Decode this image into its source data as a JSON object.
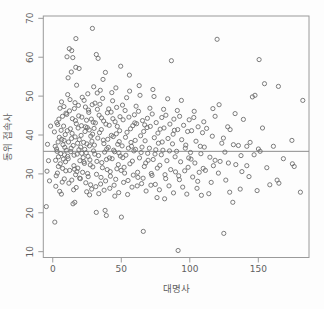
{
  "chart_data": {
    "type": "scatter",
    "title": "",
    "xlabel": "대명사",
    "ylabel": "동위 접속사",
    "x_ticks": [
      0,
      50,
      100,
      150
    ],
    "y_ticks": [
      10,
      20,
      30,
      40,
      50,
      60,
      70
    ],
    "xlim": [
      -6.9,
      187
    ],
    "ylim": [
      8.5,
      70.6
    ],
    "grid": false,
    "legend": "none",
    "marker": "open-circle",
    "hline_y": 35.8,
    "colors": {
      "background": "#fdfdfd",
      "box": "#9a9a9a",
      "points": "#6e6e6e",
      "hline": "#8c8c8c",
      "text": "#5f5f5f"
    },
    "points": [
      [
        -4.7,
        21.6
      ],
      [
        -3.1,
        33.4
      ],
      [
        -2.4,
        28.2
      ],
      [
        -3.8,
        37.6
      ],
      [
        -1.6,
        42.3
      ],
      [
        -4.2,
        30.7
      ],
      [
        1.5,
        17.6
      ],
      [
        2.1,
        33.5
      ],
      [
        2.8,
        36.4
      ],
      [
        3.4,
        30.2
      ],
      [
        1.2,
        40.8
      ],
      [
        4.5,
        44.1
      ],
      [
        5.1,
        25.5
      ],
      [
        6.3,
        24.8
      ],
      [
        5.8,
        35.2
      ],
      [
        6.6,
        38.9
      ],
      [
        7.2,
        31.4
      ],
      [
        7.9,
        42.3
      ],
      [
        8.4,
        28.7
      ],
      [
        8.8,
        36.8
      ],
      [
        9.3,
        33.1
      ],
      [
        9.7,
        45.6
      ],
      [
        3.9,
        38.2
      ],
      [
        4.2,
        34.4
      ],
      [
        2.5,
        29.5
      ],
      [
        6.1,
        41.2
      ],
      [
        7.5,
        37.5
      ],
      [
        8.1,
        47.3
      ],
      [
        9.1,
        40.1
      ],
      [
        5.5,
        32.6
      ],
      [
        3.1,
        35.8
      ],
      [
        6.9,
        27.9
      ],
      [
        9.5,
        30.8
      ],
      [
        4.8,
        39.4
      ],
      [
        2.9,
        43.2
      ],
      [
        8.6,
        34.9
      ],
      [
        1.8,
        37.1
      ],
      [
        7.1,
        44.8
      ],
      [
        5.3,
        46.9
      ],
      [
        9.9,
        36.1
      ],
      [
        4.1,
        31.9
      ],
      [
        6.4,
        48.5
      ],
      [
        3.6,
        42.7
      ],
      [
        8.3,
        38.6
      ],
      [
        2.2,
        26.8
      ],
      [
        7.7,
        33.8
      ],
      [
        10.4,
        60.1
      ],
      [
        12.1,
        62.2
      ],
      [
        13.8,
        61.7
      ],
      [
        14.6,
        59.9
      ],
      [
        16.9,
        64.8
      ],
      [
        13.5,
        56.2
      ],
      [
        16.8,
        57.4
      ],
      [
        19.2,
        57.1
      ],
      [
        11.2,
        54.7
      ],
      [
        17.4,
        52.8
      ],
      [
        14.8,
        22.3
      ],
      [
        16.1,
        22.7
      ],
      [
        10.8,
        34.5
      ],
      [
        11.5,
        38.2
      ],
      [
        12.4,
        30.9
      ],
      [
        12.9,
        41.6
      ],
      [
        13.2,
        35.7
      ],
      [
        13.9,
        28.4
      ],
      [
        14.3,
        44.2
      ],
      [
        14.9,
        37.3
      ],
      [
        15.4,
        32.1
      ],
      [
        15.8,
        46.8
      ],
      [
        16.3,
        39.5
      ],
      [
        16.7,
        29.8
      ],
      [
        17.2,
        42.9
      ],
      [
        17.8,
        35.1
      ],
      [
        18.3,
        31.5
      ],
      [
        18.7,
        47.6
      ],
      [
        19.4,
        38.8
      ],
      [
        19.8,
        33.4
      ],
      [
        10.2,
        45.3
      ],
      [
        11.8,
        27.6
      ],
      [
        12.6,
        49.1
      ],
      [
        13.4,
        36.6
      ],
      [
        14.1,
        40.4
      ],
      [
        15.2,
        25.9
      ],
      [
        16.5,
        43.7
      ],
      [
        17.6,
        30.6
      ],
      [
        18.1,
        37.9
      ],
      [
        18.9,
        44.9
      ],
      [
        19.6,
        28.9
      ],
      [
        10.6,
        41.1
      ],
      [
        11.3,
        33.9
      ],
      [
        12.2,
        46.2
      ],
      [
        13.7,
        39.1
      ],
      [
        15.6,
        34.8
      ],
      [
        16.2,
        48.3
      ],
      [
        17.1,
        26.5
      ],
      [
        18.5,
        41.8
      ],
      [
        19.1,
        36.2
      ],
      [
        10.9,
        50.4
      ],
      [
        15.9,
        31.2
      ],
      [
        28.9,
        67.4
      ],
      [
        29.9,
        52.4
      ],
      [
        21.2,
        44.6
      ],
      [
        22.5,
        38.1
      ],
      [
        23.1,
        32.7
      ],
      [
        23.8,
        47.2
      ],
      [
        24.4,
        35.4
      ],
      [
        25.2,
        41.9
      ],
      [
        25.9,
        29.3
      ],
      [
        26.3,
        45.8
      ],
      [
        27.1,
        33.6
      ],
      [
        27.8,
        39.7
      ],
      [
        28.4,
        26.1
      ],
      [
        29.5,
        43.3
      ],
      [
        20.4,
        36.9
      ],
      [
        21.8,
        30.4
      ],
      [
        22.9,
        48.9
      ],
      [
        24.1,
        27.7
      ],
      [
        25.6,
        50.6
      ],
      [
        26.8,
        37.2
      ],
      [
        28.1,
        44.1
      ],
      [
        29.2,
        31.8
      ],
      [
        20.9,
        42.4
      ],
      [
        22.2,
        34.2
      ],
      [
        23.5,
        40.9
      ],
      [
        24.8,
        25.4
      ],
      [
        26.1,
        46.4
      ],
      [
        27.4,
        32.3
      ],
      [
        28.6,
        38.4
      ],
      [
        29.7,
        35.9
      ],
      [
        20.2,
        28.8
      ],
      [
        21.5,
        49.7
      ],
      [
        23.3,
        36.3
      ],
      [
        24.6,
        43.8
      ],
      [
        25.4,
        30.1
      ],
      [
        26.6,
        41.3
      ],
      [
        27.6,
        27.2
      ],
      [
        28.8,
        47.8
      ],
      [
        20.7,
        39.9
      ],
      [
        22.7,
        33.1
      ],
      [
        24.9,
        37.7
      ],
      [
        26.9,
        24.6
      ],
      [
        29.1,
        40.2
      ],
      [
        21.1,
        35.3
      ],
      [
        23.9,
        42.1
      ],
      [
        25.8,
        34.5
      ],
      [
        31.8,
        60.7
      ],
      [
        33.1,
        59.7
      ],
      [
        38.4,
        56.1
      ],
      [
        36.7,
        54.3
      ],
      [
        34.7,
        51.5
      ],
      [
        31.8,
        20.1
      ],
      [
        38.2,
        20.6
      ],
      [
        39.1,
        19.3
      ],
      [
        30.4,
        37.4
      ],
      [
        31.1,
        43.1
      ],
      [
        31.9,
        29.9
      ],
      [
        32.6,
        46.6
      ],
      [
        33.4,
        34.7
      ],
      [
        34.1,
        40.6
      ],
      [
        34.9,
        27.4
      ],
      [
        35.6,
        44.4
      ],
      [
        36.2,
        31.6
      ],
      [
        36.9,
        38.7
      ],
      [
        37.5,
        25.8
      ],
      [
        38.8,
        42.8
      ],
      [
        39.4,
        36.4
      ],
      [
        30.8,
        48.2
      ],
      [
        32.2,
        33.2
      ],
      [
        33.8,
        45.1
      ],
      [
        35.2,
        29.1
      ],
      [
        36.4,
        49.4
      ],
      [
        37.8,
        35.6
      ],
      [
        39.7,
        31.1
      ],
      [
        30.2,
        41.7
      ],
      [
        31.4,
        26.7
      ],
      [
        32.9,
        39.2
      ],
      [
        34.4,
        47.9
      ],
      [
        35.8,
        32.9
      ],
      [
        37.1,
        43.6
      ],
      [
        38.6,
        28.2
      ],
      [
        39.9,
        45.7
      ],
      [
        30.6,
        35.1
      ],
      [
        33.6,
        24.9
      ],
      [
        35.4,
        41.4
      ],
      [
        37.3,
        37.8
      ],
      [
        39.2,
        33.7
      ],
      [
        32.4,
        50.8
      ],
      [
        49.6,
        57.7
      ],
      [
        46.1,
        52.1
      ],
      [
        40.5,
        36.8
      ],
      [
        41.2,
        42.5
      ],
      [
        41.9,
        30.6
      ],
      [
        42.6,
        45.9
      ],
      [
        43.3,
        33.9
      ],
      [
        44.1,
        39.6
      ],
      [
        44.8,
        27.1
      ],
      [
        45.5,
        43.4
      ],
      [
        46.8,
        31.3
      ],
      [
        47.4,
        37.6
      ],
      [
        48.1,
        25.2
      ],
      [
        48.8,
        41.1
      ],
      [
        49.3,
        34.6
      ],
      [
        40.8,
        46.7
      ],
      [
        42.1,
        29.4
      ],
      [
        43.7,
        48.8
      ],
      [
        45.1,
        35.7
      ],
      [
        46.4,
        40.3
      ],
      [
        47.8,
        32.4
      ],
      [
        49.1,
        44.7
      ],
      [
        40.2,
        38.9
      ],
      [
        41.6,
        26.3
      ],
      [
        43.1,
        50.9
      ],
      [
        44.5,
        36.1
      ],
      [
        45.9,
        28.6
      ],
      [
        47.1,
        42.2
      ],
      [
        48.5,
        38.3
      ],
      [
        49.9,
        30.9
      ],
      [
        41.4,
        34.1
      ],
      [
        43.9,
        44.2
      ],
      [
        45.3,
        24.3
      ],
      [
        46.6,
        47.1
      ],
      [
        48.3,
        35.4
      ],
      [
        42.8,
        39.9
      ],
      [
        50.1,
        18.9
      ],
      [
        50.6,
        37.2
      ],
      [
        51.3,
        43.9
      ],
      [
        52.1,
        31.7
      ],
      [
        52.8,
        46.3
      ],
      [
        53.4,
        34.8
      ],
      [
        54.2,
        40.7
      ],
      [
        54.9,
        28.3
      ],
      [
        55.6,
        44.6
      ],
      [
        56.3,
        32.6
      ],
      [
        57.1,
        38.1
      ],
      [
        57.8,
        26.6
      ],
      [
        58.4,
        42.4
      ],
      [
        59.2,
        35.9
      ],
      [
        50.9,
        47.7
      ],
      [
        52.4,
        30.2
      ],
      [
        53.9,
        49.6
      ],
      [
        55.2,
        36.6
      ],
      [
        56.7,
        41.6
      ],
      [
        58.1,
        33.3
      ],
      [
        59.6,
        45.2
      ],
      [
        51.7,
        27.8
      ],
      [
        53.1,
        39.4
      ],
      [
        54.6,
        24.7
      ],
      [
        56.1,
        51.3
      ],
      [
        57.5,
        37.1
      ],
      [
        58.8,
        29.7
      ],
      [
        59.9,
        43.1
      ],
      [
        51.1,
        34.2
      ],
      [
        55.9,
        55.4
      ],
      [
        66.1,
        15.2
      ],
      [
        60.4,
        36.3
      ],
      [
        61.2,
        42.9
      ],
      [
        61.9,
        30.4
      ],
      [
        62.6,
        46.1
      ],
      [
        63.3,
        34.1
      ],
      [
        64.1,
        39.8
      ],
      [
        64.8,
        27.5
      ],
      [
        65.5,
        43.7
      ],
      [
        66.8,
        31.9
      ],
      [
        67.4,
        38.5
      ],
      [
        68.1,
        25.6
      ],
      [
        68.8,
        41.9
      ],
      [
        69.3,
        35.3
      ],
      [
        60.8,
        47.4
      ],
      [
        62.1,
        29.1
      ],
      [
        63.7,
        50.2
      ],
      [
        65.1,
        36.9
      ],
      [
        66.4,
        40.9
      ],
      [
        67.8,
        32.8
      ],
      [
        69.1,
        44.3
      ],
      [
        60.2,
        38.6
      ],
      [
        61.6,
        26.9
      ],
      [
        63.1,
        52.7
      ],
      [
        64.5,
        35.5
      ],
      [
        65.9,
        28.9
      ],
      [
        67.1,
        42.6
      ],
      [
        69.6,
        33.5
      ],
      [
        70.5,
        36.6
      ],
      [
        71.2,
        42.2
      ],
      [
        71.9,
        30.1
      ],
      [
        72.6,
        45.4
      ],
      [
        73.3,
        33.7
      ],
      [
        74.1,
        39.3
      ],
      [
        74.8,
        27.3
      ],
      [
        75.5,
        43.2
      ],
      [
        76.3,
        31.5
      ],
      [
        77.1,
        37.9
      ],
      [
        77.8,
        25.9
      ],
      [
        78.4,
        41.5
      ],
      [
        79.2,
        34.9
      ],
      [
        70.9,
        46.9
      ],
      [
        72.4,
        29.6
      ],
      [
        73.9,
        49.9
      ],
      [
        75.2,
        36.2
      ],
      [
        76.7,
        40.5
      ],
      [
        78.1,
        32.2
      ],
      [
        79.6,
        44.5
      ],
      [
        71.6,
        27.1
      ],
      [
        73.1,
        51.7
      ],
      [
        74.6,
        35.1
      ],
      [
        76.1,
        23.9
      ],
      [
        79.9,
        38.2
      ],
      [
        86.6,
        59.1
      ],
      [
        80.4,
        36.1
      ],
      [
        81.2,
        41.8
      ],
      [
        81.9,
        29.8
      ],
      [
        82.6,
        45.1
      ],
      [
        83.3,
        33.4
      ],
      [
        84.1,
        39.1
      ],
      [
        84.8,
        26.9
      ],
      [
        85.5,
        42.8
      ],
      [
        86.1,
        31.1
      ],
      [
        87.4,
        37.7
      ],
      [
        88.1,
        25.1
      ],
      [
        88.8,
        41.2
      ],
      [
        89.3,
        34.4
      ],
      [
        80.9,
        46.6
      ],
      [
        82.4,
        28.8
      ],
      [
        83.9,
        49.3
      ],
      [
        85.2,
        35.9
      ],
      [
        87.8,
        40.2
      ],
      [
        89.6,
        30.5
      ],
      [
        81.6,
        23.6
      ],
      [
        88.4,
        44.1
      ],
      [
        91.5,
        10.3
      ],
      [
        90.4,
        35.8
      ],
      [
        91.2,
        41.4
      ],
      [
        91.9,
        29.5
      ],
      [
        92.6,
        44.8
      ],
      [
        93.3,
        33.1
      ],
      [
        94.1,
        38.8
      ],
      [
        94.8,
        26.6
      ],
      [
        95.5,
        42.5
      ],
      [
        96.3,
        30.8
      ],
      [
        97.1,
        37.4
      ],
      [
        97.8,
        24.8
      ],
      [
        98.4,
        40.9
      ],
      [
        99.2,
        34.1
      ],
      [
        90.9,
        46.3
      ],
      [
        92.4,
        28.5
      ],
      [
        93.9,
        48.9
      ],
      [
        96.7,
        36.6
      ],
      [
        98.8,
        31.7
      ],
      [
        99.6,
        43.9
      ],
      [
        100.5,
        35.5
      ],
      [
        101.3,
        41.1
      ],
      [
        102.1,
        29.2
      ],
      [
        102.9,
        44.5
      ],
      [
        103.7,
        32.8
      ],
      [
        104.5,
        38.4
      ],
      [
        105.3,
        26.3
      ],
      [
        106.1,
        42.1
      ],
      [
        106.9,
        30.4
      ],
      [
        107.7,
        37.1
      ],
      [
        108.5,
        24.5
      ],
      [
        109.3,
        40.6
      ],
      [
        100.9,
        33.8
      ],
      [
        103.2,
        46.1
      ],
      [
        105.8,
        28.1
      ],
      [
        108.1,
        35.2
      ],
      [
        109.8,
        31.4
      ],
      [
        119.9,
        64.6
      ],
      [
        118.5,
        44.8
      ],
      [
        118.5,
        33.5
      ],
      [
        113.9,
        24.9
      ],
      [
        110.6,
        36.9
      ],
      [
        111.4,
        30.9
      ],
      [
        112.3,
        41.7
      ],
      [
        114.7,
        34.3
      ],
      [
        115.6,
        27.8
      ],
      [
        116.4,
        39.7
      ],
      [
        117.2,
        32.1
      ],
      [
        110.2,
        43.4
      ],
      [
        116.9,
        46.8
      ],
      [
        124.8,
        14.7
      ],
      [
        121.4,
        47.8
      ],
      [
        127.7,
        42.1
      ],
      [
        129.4,
        41.4
      ],
      [
        124.5,
        39.2
      ],
      [
        123.4,
        37.9
      ],
      [
        122.1,
        33.2
      ],
      [
        128.2,
        32.8
      ],
      [
        120.9,
        30.2
      ],
      [
        126.3,
        28.4
      ],
      [
        125.6,
        35.6
      ],
      [
        129.1,
        25.3
      ],
      [
        133.1,
        45.5
      ],
      [
        139.1,
        44.0
      ],
      [
        131.8,
        37.5
      ],
      [
        135.5,
        37.3
      ],
      [
        133.6,
        32.4
      ],
      [
        138.0,
        30.6
      ],
      [
        131.4,
        22.7
      ],
      [
        136.8,
        26.1
      ],
      [
        137.4,
        34.7
      ],
      [
        145.7,
        49.8
      ],
      [
        147.6,
        50.2
      ],
      [
        141.6,
        37.1
      ],
      [
        144.0,
        38.1
      ],
      [
        141.6,
        32.1
      ],
      [
        149.1,
        25.7
      ],
      [
        143.2,
        29.3
      ],
      [
        146.9,
        34.9
      ],
      [
        150.6,
        59.4
      ],
      [
        154.5,
        53.2
      ],
      [
        150.1,
        36.4
      ],
      [
        151.3,
        35.8
      ],
      [
        156.2,
        31.6
      ],
      [
        158.4,
        27.2
      ],
      [
        153.1,
        41.8
      ],
      [
        164.7,
        52.5
      ],
      [
        161.0,
        37.1
      ],
      [
        163.7,
        28.4
      ],
      [
        165.0,
        27.6
      ],
      [
        168.3,
        33.9
      ],
      [
        182.5,
        48.9
      ],
      [
        174.5,
        38.6
      ],
      [
        174.9,
        32.6
      ],
      [
        176.2,
        31.9
      ],
      [
        180.7,
        25.3
      ]
    ]
  }
}
